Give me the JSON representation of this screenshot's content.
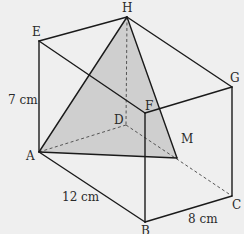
{
  "diagram": {
    "type": "cuboid-with-shaded-triangle",
    "background": "#efefef",
    "shade_color": "#cfcfcf",
    "line_color": "#1a1a1a",
    "vertices": {
      "A": {
        "label": "A",
        "x": 39,
        "y": 152
      },
      "B": {
        "label": "B",
        "x": 145,
        "y": 222
      },
      "C": {
        "label": "C",
        "x": 232,
        "y": 196
      },
      "D": {
        "label": "D",
        "x": 126,
        "y": 125
      },
      "E": {
        "label": "E",
        "x": 39,
        "y": 41
      },
      "F": {
        "label": "F",
        "x": 145,
        "y": 113
      },
      "G": {
        "label": "G",
        "x": 232,
        "y": 87
      },
      "H": {
        "label": "H",
        "x": 127,
        "y": 17
      },
      "M": {
        "label": "M",
        "x": 177,
        "y": 158
      }
    },
    "dimensions": {
      "AE": "7 cm",
      "AB": "12 cm",
      "BC": "8 cm"
    },
    "labels": {
      "H": "H",
      "E": "E",
      "G": "G",
      "F": "F",
      "D": "D",
      "M": "M",
      "A": "A",
      "C": "C",
      "B": "B",
      "height": "7 cm",
      "length": "12 cm",
      "width": "8 cm"
    },
    "shaded_triangle": [
      "A",
      "H",
      "M"
    ],
    "hidden_edges": [
      [
        "H",
        "D"
      ],
      [
        "D",
        "A"
      ],
      [
        "D",
        "C"
      ]
    ]
  }
}
